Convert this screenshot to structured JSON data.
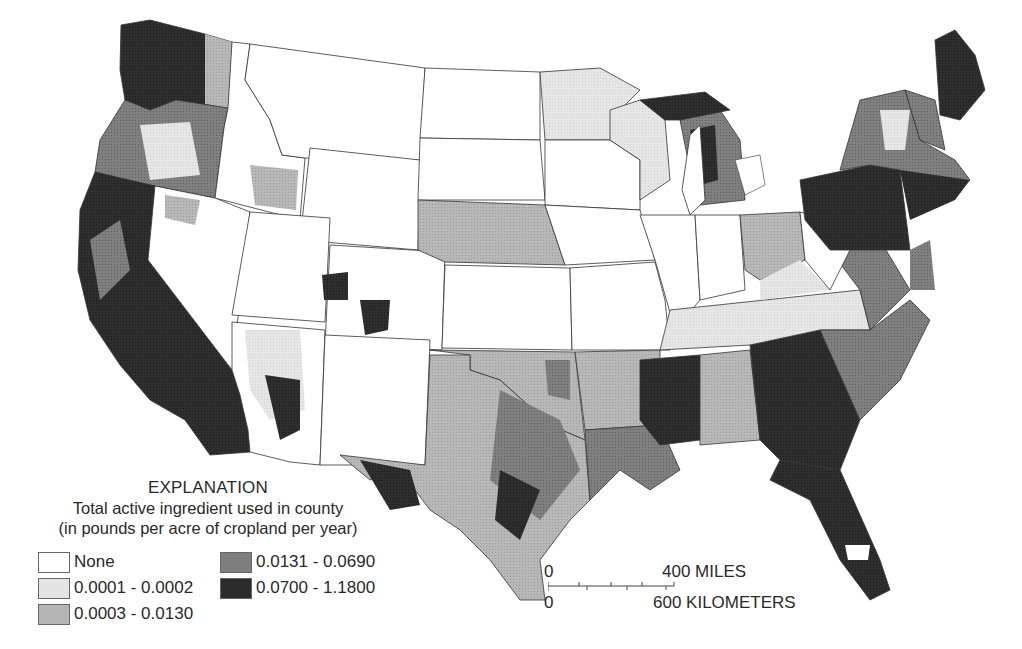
{
  "map": {
    "title": "Total active ingredient used in county",
    "projection": "Conterminous United States, county-level choropleth",
    "colors": {
      "none": "#ffffff",
      "class1": "#e4e4e4",
      "class2": "#b4b4b4",
      "class3": "#7e7e7e",
      "class4": "#2c2c2c",
      "border": "#333333"
    }
  },
  "legend": {
    "heading": "EXPLANATION",
    "subtitle_1": "Total active ingredient used in county",
    "subtitle_2": "(in pounds per acre of cropland per year)",
    "items": [
      {
        "label": "None",
        "color": "#ffffff"
      },
      {
        "label": "0.0001 - 0.0002",
        "color": "#e4e4e4"
      },
      {
        "label": "0.0003 - 0.0130",
        "color": "#b4b4b4"
      },
      {
        "label": "0.0131 - 0.0690",
        "color": "#7e7e7e"
      },
      {
        "label": "0.0700 - 1.1800",
        "color": "#2c2c2c"
      }
    ]
  },
  "scale_bar": {
    "miles_zero": "0",
    "miles_label": "400 MILES",
    "km_zero": "0",
    "km_label": "600 KILOMETERS"
  }
}
